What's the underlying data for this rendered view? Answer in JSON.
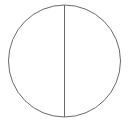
{
  "canvas": {
    "width": 128,
    "height": 124,
    "background_color": "#ffffff"
  },
  "figure": {
    "name": "circle-with-vertical-diameter",
    "stroke_color": "#6a6a6a",
    "fill_color": "none",
    "stroke_width": 1,
    "caption": ""
  },
  "shapes": {
    "circle": {
      "label": "circle-outline",
      "center_x": 64.5,
      "center_y": 61,
      "radius": 56,
      "stroke_color": "#6a6a6a",
      "fill_color": "none",
      "stroke_width": 1
    },
    "diameter": {
      "label": "vertical-diameter-line",
      "x1": 64.5,
      "y1": 5,
      "x2": 64.5,
      "y2": 117,
      "stroke_color": "#6a6a6a",
      "stroke_width": 1
    }
  }
}
